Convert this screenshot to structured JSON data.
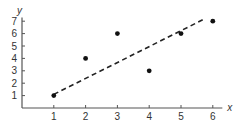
{
  "chart_data": {
    "type": "scatter",
    "title": "",
    "xlabel": "x",
    "ylabel": "y",
    "xlim": [
      0,
      6.3
    ],
    "ylim": [
      0,
      7.3
    ],
    "x_ticks": [
      1,
      2,
      3,
      4,
      5,
      6
    ],
    "y_ticks": [
      1,
      2,
      3,
      4,
      5,
      6,
      7
    ],
    "grid": false,
    "legend": null,
    "series": [
      {
        "name": "data points",
        "type": "scatter",
        "x": [
          1,
          2,
          3,
          4,
          5,
          6
        ],
        "y": [
          1,
          4,
          6,
          3,
          6,
          7
        ]
      },
      {
        "name": "trend line",
        "type": "line",
        "style": "dashed",
        "x": [
          1,
          5.75
        ],
        "y": [
          1.1,
          7.2
        ]
      }
    ]
  },
  "colors": {
    "axis": "#555555",
    "points": "#111111",
    "trend": "#222222",
    "text": "#333333"
  },
  "layout": {
    "origin_px": [
      22,
      108
    ],
    "x_unit_px": 31.8,
    "y_unit_px": 12.4
  }
}
